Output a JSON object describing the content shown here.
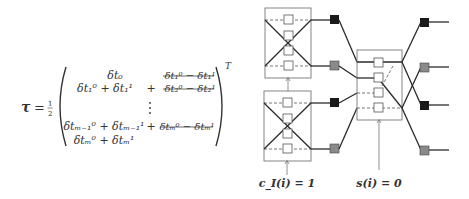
{
  "equation": {
    "lhs": "τ",
    "equals": "=",
    "coefficient": "1/2",
    "transpose": "T",
    "rows": [
      {
        "left": "δt₀",
        "op": "",
        "right": "δt₁⁰ − δt₁¹",
        "right_struck": true
      },
      {
        "left": "δt₁⁰ + δt₁¹",
        "op": "+",
        "right": "δt₂⁰ − δt₂¹",
        "right_struck": true
      },
      {
        "left": "",
        "op": "⋮",
        "right": ""
      },
      {
        "left": "δtₘ₋₁⁰ + δtₘ₋₁¹",
        "op": "+",
        "right": "δtₘ⁰ − δtₘ¹",
        "right_struck": true
      },
      {
        "left": "δtₘ⁰ + δtₘ¹",
        "op": "",
        "right": ""
      }
    ]
  },
  "diagram": {
    "labels": {
      "left_arrow": "c_I(i) = 1",
      "center_arrow": "s(i) = 0"
    },
    "colors": {
      "dark_node": "#1a1a1a",
      "gray_node": "#8a8a8a",
      "line": "#2a2a2a",
      "box_border": "#777777"
    },
    "boxes": [
      {
        "name": "left-top-switch",
        "slots": 4
      },
      {
        "name": "left-bottom-switch",
        "slots": 4
      },
      {
        "name": "center-switch",
        "slots": 4
      }
    ],
    "nodes": {
      "middle_column": [
        "dark",
        "gray",
        "dark",
        "gray"
      ],
      "right_column": [
        "dark",
        "gray",
        "dark",
        "gray"
      ]
    }
  }
}
